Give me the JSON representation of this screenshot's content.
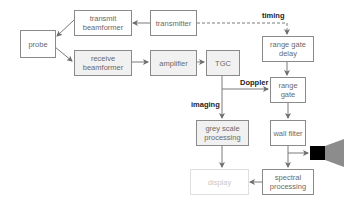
{
  "diagram": {
    "boxes": {
      "probe": "probe",
      "transmit_beamformer": "transmit beamformer",
      "transmitter": "transmitter",
      "receive_beamformer": "receive beamformer",
      "amplifier": "amplifier",
      "tgc": "TGC",
      "range_gate_delay": "range gate delay",
      "range_gate": "range gate",
      "wall_filter": "wall filter",
      "grey_scale_processing": "grey scale processing",
      "spectral_processing": "spectral processing",
      "display": "display"
    },
    "labels": {
      "timing": "timing",
      "doppler": "Doppler",
      "imaging": "imaging"
    },
    "icons": {
      "speaker": "speaker-icon"
    },
    "colors": {
      "line": "#7a7a7a",
      "box_border": "#8a8a8a",
      "box_fill_gray": "#f1f1f1",
      "display_faint": "#dedede",
      "speaker_body": "#000000",
      "speaker_cone": "#8c8c8c"
    }
  }
}
